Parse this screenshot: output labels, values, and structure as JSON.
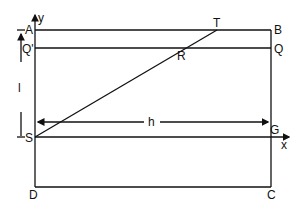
{
  "diagram": {
    "points": {
      "A": "A",
      "B": "B",
      "Q_prime": "Q'",
      "Q": "Q",
      "R": "R",
      "T": "T",
      "S": "S",
      "G": "G",
      "D": "D",
      "C": "C"
    },
    "axes": {
      "x": "x",
      "y": "y"
    },
    "dimensions": {
      "l": "l",
      "h": "h"
    }
  }
}
